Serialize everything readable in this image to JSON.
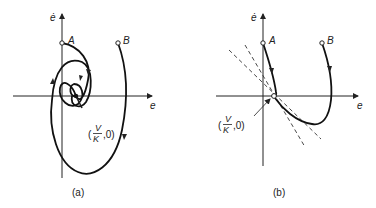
{
  "figure": {
    "panels": [
      {
        "id": "a",
        "caption": "(a)",
        "x_axis_label": "e",
        "y_axis_label": "ė",
        "points": [
          {
            "label": "A"
          },
          {
            "label": "B"
          }
        ],
        "equilibrium": {
          "open": "(",
          "numerator": "V",
          "denominator": "K",
          "close": ",0)"
        },
        "description": "Spiral trajectories from A and B converging to equilibrium (V/K, 0)"
      },
      {
        "id": "b",
        "caption": "(b)",
        "x_axis_label": "e",
        "y_axis_label": "ė",
        "points": [
          {
            "label": "A"
          },
          {
            "label": "B"
          }
        ],
        "equilibrium": {
          "open": "(",
          "numerator": "V",
          "denominator": "K",
          "close": ",0)"
        },
        "description": "Non-oscillatory trajectories from A and B approaching equilibrium (V/K, 0) along dashed asymptotic lines"
      }
    ]
  }
}
